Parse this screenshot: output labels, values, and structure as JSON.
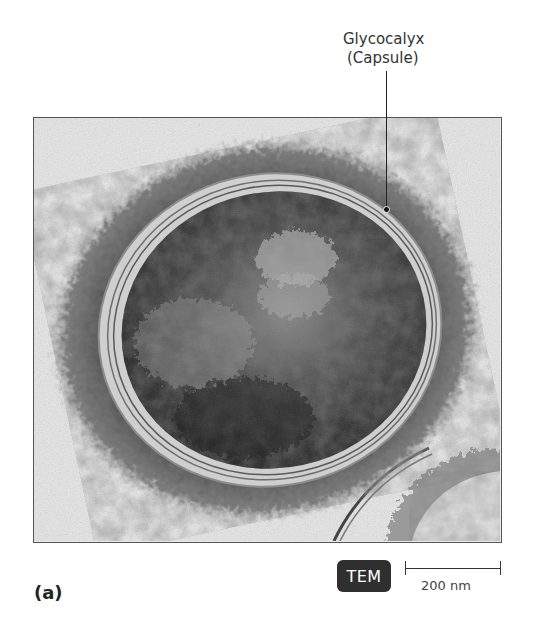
{
  "figure": {
    "panel_label": "(a)",
    "callout": {
      "line1": "Glycocalyx",
      "line2": "(Capsule)"
    },
    "micrograph": {
      "subject": "bacterial cell with glycocalyx capsule",
      "type_badge": "TEM"
    },
    "scale_bar": {
      "label": "200 nm"
    },
    "colors": {
      "badge_bg": "#2f2f2f",
      "badge_text": "#ffffff",
      "frame": "#555555",
      "text": "#333333"
    }
  }
}
